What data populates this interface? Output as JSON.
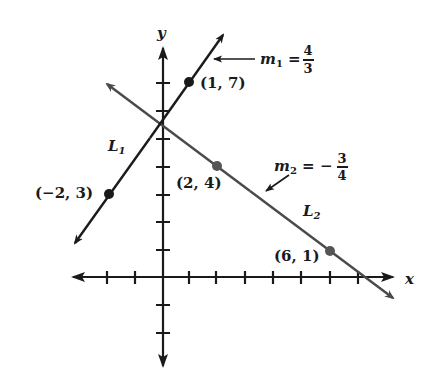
{
  "diagram": {
    "axes": {
      "x_label": "x",
      "y_label": "y",
      "x_ticks": [
        -2,
        -1,
        1,
        2,
        3,
        4,
        5,
        6,
        7
      ],
      "y_ticks": [
        -2,
        -1,
        1,
        2,
        3,
        4,
        5,
        6,
        7
      ]
    },
    "lines": [
      {
        "name": "L1",
        "label": "L",
        "label_sub": "1",
        "slope_label": "m",
        "slope_sub": "1",
        "slope_eq": "=",
        "slope_sign": "",
        "slope_num": "4",
        "slope_den": "3",
        "color": "#1a1a1a",
        "points": [
          {
            "x": -2,
            "y": 3,
            "label": "(−2, 3)"
          },
          {
            "x": 1,
            "y": 7,
            "label": "(1, 7)"
          }
        ]
      },
      {
        "name": "L2",
        "label": "L",
        "label_sub": "2",
        "slope_label": "m",
        "slope_sub": "2",
        "slope_eq": "=",
        "slope_sign": "−",
        "slope_num": "3",
        "slope_den": "4",
        "color": "#4a4a4a",
        "points": [
          {
            "x": 2,
            "y": 4,
            "label": "(2, 4)"
          },
          {
            "x": 6,
            "y": 1,
            "label": "(6, 1)"
          }
        ]
      }
    ]
  }
}
